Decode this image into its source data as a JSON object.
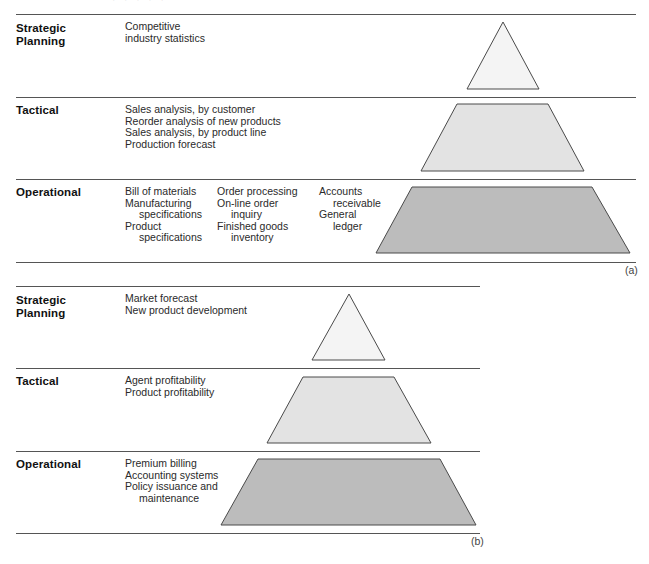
{
  "figure": {
    "top_cropped_text": "· · · · ·",
    "colors": {
      "line": "#555555",
      "strategic_fill": "#f4f4f4",
      "tactical_fill": "#e3e3e3",
      "operational_fill": "#bcbcbc",
      "outline": "#4a4a4a"
    }
  },
  "panel_a": {
    "caption": "(a)",
    "levels": [
      {
        "label_lines": [
          "Strategic",
          "Planning"
        ],
        "columns": [
          [
            {
              "text": "Competitive"
            },
            {
              "text": "industry statistics"
            }
          ]
        ]
      },
      {
        "label_lines": [
          "Tactical"
        ],
        "columns": [
          [
            {
              "text": "Sales analysis, by customer"
            },
            {
              "text": "Reorder analysis of new products"
            },
            {
              "text": "Sales analysis, by product line"
            },
            {
              "text": "Production forecast"
            }
          ]
        ]
      },
      {
        "label_lines": [
          "Operational"
        ],
        "columns": [
          [
            {
              "text": "Bill of materials"
            },
            {
              "text": "Manufacturing"
            },
            {
              "text": "specifications",
              "indent": true
            },
            {
              "text": "Product"
            },
            {
              "text": "specifications",
              "indent": true
            }
          ],
          [
            {
              "text": "Order processing"
            },
            {
              "text": "On-line order"
            },
            {
              "text": "inquiry",
              "indent": true
            },
            {
              "text": "Finished goods"
            },
            {
              "text": "inventory",
              "indent": true
            }
          ],
          [
            {
              "text": "Accounts"
            },
            {
              "text": "receivable",
              "indent": true
            },
            {
              "text": "General"
            },
            {
              "text": "ledger",
              "indent": true
            }
          ]
        ]
      }
    ]
  },
  "panel_b": {
    "caption": "(b)",
    "levels": [
      {
        "label_lines": [
          "Strategic",
          "Planning"
        ],
        "columns": [
          [
            {
              "text": "Market forecast"
            },
            {
              "text": "New product development"
            }
          ]
        ]
      },
      {
        "label_lines": [
          "Tactical"
        ],
        "columns": [
          [
            {
              "text": "Agent profitability"
            },
            {
              "text": "Product profitability"
            }
          ]
        ]
      },
      {
        "label_lines": [
          "Operational"
        ],
        "columns": [
          [
            {
              "text": "Premium billing"
            },
            {
              "text": "Accounting systems"
            },
            {
              "text": "Policy issuance and"
            },
            {
              "text": "maintenance",
              "indent": true
            }
          ]
        ]
      }
    ]
  }
}
